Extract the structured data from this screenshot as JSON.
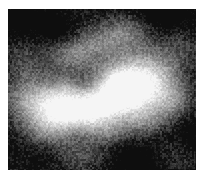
{
  "figure": {
    "kind": "grayscale-noise-texture",
    "title": "",
    "canvas_width": 201,
    "canvas_height": 177,
    "background_color": "#ffffff",
    "panel": {
      "x": 8,
      "y": 9,
      "width": 188,
      "height": 161,
      "border": "none"
    }
  },
  "chart_data": {
    "type": "heatmap",
    "title": "",
    "subtitle": "",
    "xlabel": "",
    "ylabel": "",
    "grid": false,
    "legend": "none",
    "colormap": "gray",
    "value_range": [
      0,
      255
    ],
    "grid_size": {
      "cols": 16,
      "rows": 14
    },
    "axis_ranges": {
      "x": [
        0,
        188
      ],
      "y": [
        0,
        161
      ]
    },
    "intensity_extremes": {
      "min_gray": 14,
      "max_gray": 245,
      "mean_gray": 108
    },
    "grain": {
      "type": "per-pixel-additive",
      "amplitude": 30,
      "cell_px": 2
    },
    "blobs": [
      {
        "cx": 0.66,
        "cy": 0.52,
        "rx": 0.17,
        "ry": 0.17,
        "amp": 150
      },
      {
        "cx": 0.58,
        "cy": 0.46,
        "rx": 0.13,
        "ry": 0.12,
        "amp": 120
      },
      {
        "cx": 0.4,
        "cy": 0.66,
        "rx": 0.16,
        "ry": 0.12,
        "amp": 140
      },
      {
        "cx": 0.26,
        "cy": 0.63,
        "rx": 0.13,
        "ry": 0.11,
        "amp": 110
      },
      {
        "cx": 0.13,
        "cy": 0.55,
        "rx": 0.14,
        "ry": 0.15,
        "amp": 105
      },
      {
        "cx": 0.5,
        "cy": 0.58,
        "rx": 0.15,
        "ry": 0.09,
        "amp": 110
      },
      {
        "cx": 0.78,
        "cy": 0.4,
        "rx": 0.14,
        "ry": 0.16,
        "amp": 95
      },
      {
        "cx": 0.88,
        "cy": 0.58,
        "rx": 0.12,
        "ry": 0.14,
        "amp": 80
      },
      {
        "cx": 0.46,
        "cy": 0.22,
        "rx": 0.16,
        "ry": 0.11,
        "amp": 78
      },
      {
        "cx": 0.33,
        "cy": 0.3,
        "rx": 0.12,
        "ry": 0.1,
        "amp": 60
      },
      {
        "cx": 0.63,
        "cy": 0.14,
        "rx": 0.13,
        "ry": 0.1,
        "amp": 62
      },
      {
        "cx": 0.2,
        "cy": 0.78,
        "rx": 0.12,
        "ry": 0.1,
        "amp": 72
      },
      {
        "cx": 0.55,
        "cy": 0.77,
        "rx": 0.11,
        "ry": 0.08,
        "amp": 55
      },
      {
        "cx": 0.72,
        "cy": 0.7,
        "rx": 0.1,
        "ry": 0.09,
        "amp": 48
      },
      {
        "cx": 0.05,
        "cy": 0.3,
        "rx": 0.11,
        "ry": 0.12,
        "amp": 42
      },
      {
        "cx": 0.95,
        "cy": 0.22,
        "rx": 0.1,
        "ry": 0.12,
        "amp": 40
      },
      {
        "cx": 0.4,
        "cy": 0.92,
        "rx": 0.13,
        "ry": 0.09,
        "amp": 35
      },
      {
        "cx": 0.88,
        "cy": 0.88,
        "rx": 0.11,
        "ry": 0.1,
        "amp": 30
      },
      {
        "cx": 0.08,
        "cy": 0.92,
        "rx": 0.1,
        "ry": 0.08,
        "amp": 28
      },
      {
        "cx": 0.3,
        "cy": 0.5,
        "rx": 0.09,
        "ry": 0.08,
        "amp": 70
      }
    ],
    "dark_wells": [
      {
        "cx": 0.1,
        "cy": 0.08,
        "rx": 0.16,
        "ry": 0.14,
        "amp": 70
      },
      {
        "cx": 0.85,
        "cy": 0.06,
        "rx": 0.16,
        "ry": 0.13,
        "amp": 66
      },
      {
        "cx": 0.12,
        "cy": 0.9,
        "rx": 0.15,
        "ry": 0.12,
        "amp": 62
      },
      {
        "cx": 0.68,
        "cy": 0.93,
        "rx": 0.17,
        "ry": 0.13,
        "amp": 64
      },
      {
        "cx": 0.94,
        "cy": 0.78,
        "rx": 0.13,
        "ry": 0.14,
        "amp": 58
      },
      {
        "cx": 0.28,
        "cy": 0.12,
        "rx": 0.12,
        "ry": 0.1,
        "amp": 50
      }
    ],
    "base_level": 52,
    "octaves": [
      {
        "freq": 1.5,
        "weight": 1.0
      },
      {
        "freq": 3.1,
        "weight": 0.5
      },
      {
        "freq": 6.3,
        "weight": 0.26
      },
      {
        "freq": 12.7,
        "weight": 0.13
      }
    ],
    "row_means": [
      38,
      44,
      58,
      72,
      88,
      104,
      126,
      142,
      150,
      138,
      118,
      96,
      72,
      52
    ],
    "col_means": [
      62,
      70,
      84,
      96,
      108,
      118,
      126,
      136,
      142,
      138,
      128,
      116,
      104,
      92,
      80,
      66
    ]
  }
}
